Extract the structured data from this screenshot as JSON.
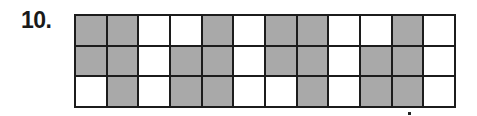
{
  "problem": {
    "number_label": "10."
  },
  "grid": {
    "rows": 3,
    "columns": 12,
    "colors": {
      "shaded": "#a9a9a9",
      "unshaded": "#ffffff",
      "border": "#1c1c1c"
    },
    "cells": [
      [
        1,
        1,
        0,
        0,
        1,
        0,
        1,
        1,
        0,
        0,
        1,
        0
      ],
      [
        1,
        1,
        0,
        1,
        1,
        0,
        1,
        1,
        0,
        1,
        1,
        0
      ],
      [
        0,
        1,
        0,
        1,
        1,
        0,
        0,
        1,
        0,
        1,
        1,
        0
      ]
    ]
  }
}
